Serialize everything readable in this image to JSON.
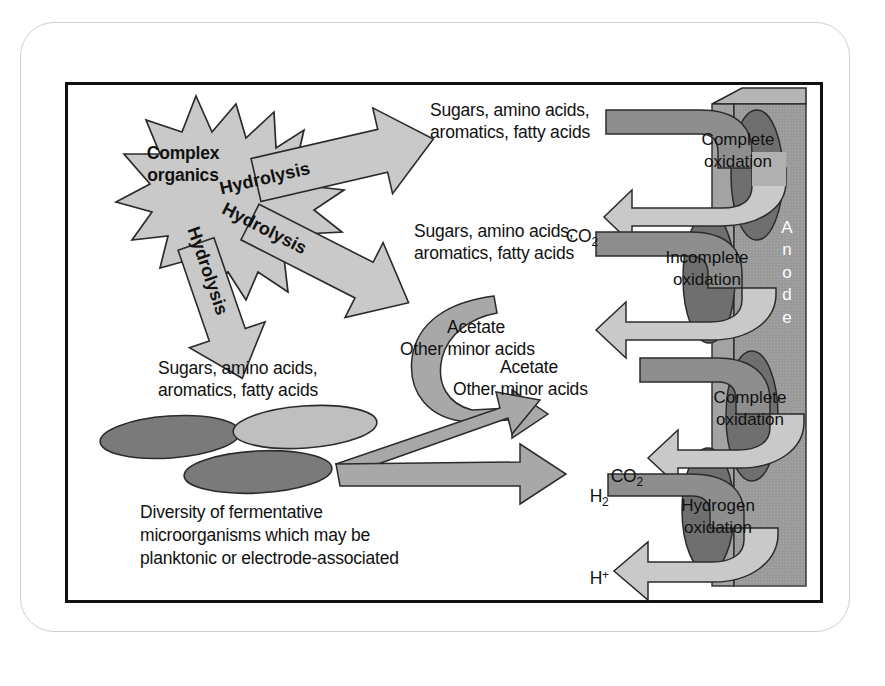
{
  "figure": {
    "domain": "scientific-schematic",
    "title_visible": false
  },
  "frame": {
    "outer_border_color": "#cfcfcf",
    "inner_border_color": "#111111",
    "background": "#ffffff"
  },
  "palette": {
    "arrow_light": "#c9c9c9",
    "arrow_mid": "#a8a8a8",
    "arrow_dark": "#8e8e8e",
    "anode_body": "#9a9a9a",
    "anode_top": "#b5b5b5",
    "biofilm_dark": "#6f6f6f",
    "cell_dark": "#7a7a7a",
    "cell_light": "#bfbfbf",
    "outline": "#2b2b2b",
    "text": "#111111",
    "anode_label_text": "#ffffff"
  },
  "burst": {
    "label_line1": "Complex",
    "label_line2": "organics",
    "fill": "#c9c9c9"
  },
  "hydrolysis_arrows": [
    {
      "label": "Hydrolysis",
      "rotation_deg": -13,
      "name": "hydrolysis-arrow-top"
    },
    {
      "label": "Hydrolysis",
      "rotation_deg": 27,
      "name": "hydrolysis-arrow-middle"
    },
    {
      "label": "Hydrolysis",
      "rotation_deg": 71,
      "name": "hydrolysis-arrow-bottom"
    }
  ],
  "substrate_labels": [
    {
      "name": "substrate-top-right",
      "line1": "Sugars, amino acids,",
      "line2": "aromatics, fatty acids"
    },
    {
      "name": "substrate-middle-right",
      "line1": "Sugars, amino acids,",
      "line2": "aromatics, fatty acids"
    },
    {
      "name": "substrate-left",
      "line1": "Sugars, amino acids,",
      "line2": "aromatics, fatty acids"
    }
  ],
  "product_labels": [
    {
      "name": "co2-upper",
      "text": "CO",
      "subscript": "2"
    },
    {
      "name": "acetate-upper",
      "line1": "Acetate",
      "line2": "Other minor acids"
    },
    {
      "name": "acetate-lower",
      "line1": "Acetate",
      "line2": "Other minor acids"
    },
    {
      "name": "co2-lower",
      "text": "CO",
      "subscript": "2"
    },
    {
      "name": "h2-label",
      "text": "H",
      "subscript": "2"
    },
    {
      "name": "hplus-label",
      "text": "H",
      "superscript": "+"
    }
  ],
  "oxidation_steps": [
    {
      "name": "complete-oxidation-1",
      "line1": "Complete",
      "line2": "oxidation"
    },
    {
      "name": "incomplete-oxidation-1",
      "line1": "Incomplete",
      "line2": "oxidation"
    },
    {
      "name": "complete-oxidation-2",
      "line1": "Complete",
      "line2": "oxidation"
    },
    {
      "name": "hydrogen-oxidation",
      "line1": "Hydrogen",
      "line2": "oxidation"
    }
  ],
  "anode": {
    "label": "Anode",
    "letters": [
      "A",
      "n",
      "o",
      "d",
      "e"
    ],
    "orientation": "vertical",
    "biofilm_count": 4
  },
  "caption_block": {
    "line1": "Diversity of fermentative",
    "line2": "microorganisms which may be",
    "line3": "planktonic or electrode-associated"
  },
  "microorganisms": [
    {
      "name": "cell-ellipse-dark-left",
      "shade": "dark"
    },
    {
      "name": "cell-ellipse-light-right",
      "shade": "light"
    },
    {
      "name": "cell-ellipse-dark-bottom",
      "shade": "dark"
    }
  ]
}
